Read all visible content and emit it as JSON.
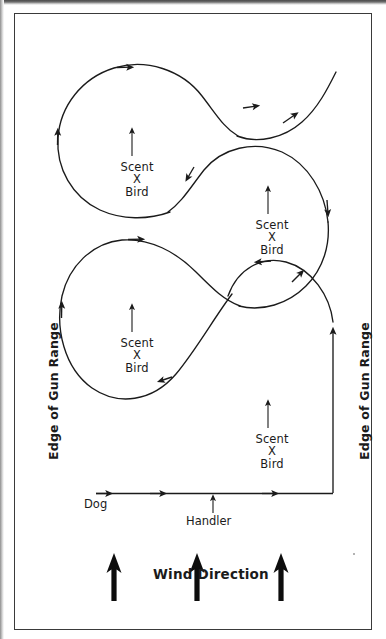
{
  "figure": {
    "line_color": "#1b1b1b",
    "frame_color": "#3a3a3a",
    "background": "#ffffff"
  },
  "labels": {
    "edge_left": "Edge of Gun Range",
    "edge_right": "Edge of Gun Range",
    "dog": "Dog",
    "handler": "Handler",
    "wind": "Wind Direction"
  },
  "scent_markers": [
    {
      "id": "scent-1",
      "line1": "Scent",
      "line2": "X",
      "line3": "Bird",
      "x": 137,
      "y": 161
    },
    {
      "id": "scent-2",
      "line1": "Scent",
      "line2": "X",
      "line3": "Bird",
      "x": 272,
      "y": 219
    },
    {
      "id": "scent-3",
      "line1": "Scent",
      "line2": "X",
      "line3": "Bird",
      "x": 137,
      "y": 337
    },
    {
      "id": "scent-4",
      "line1": "Scent",
      "line2": "X",
      "line3": "Bird",
      "x": 272,
      "y": 433
    }
  ],
  "wind_arrows": [
    {
      "id": "wind-arrow-1",
      "x": 114
    },
    {
      "id": "wind-arrow-2",
      "x": 197
    },
    {
      "id": "wind-arrow-3",
      "x": 281
    }
  ],
  "chart_data": {
    "type": "diagram",
    "annotations": [
      "Edge of Gun Range",
      "Edge of Gun Range",
      "Dog",
      "Handler",
      "Wind Direction",
      "Scent X Bird"
    ],
    "elements": [
      {
        "name": "dog-path",
        "kind": "serpentine-curve",
        "direction": "counter-clockwise loops advancing upward"
      },
      {
        "name": "handler-path",
        "kind": "horizontal-line-with-arrowheads",
        "arrowheads": 3
      },
      {
        "name": "right-vertical-path",
        "kind": "vertical-line-with-arrowhead",
        "arrowheads": 1
      },
      {
        "name": "wind-arrows",
        "kind": "thick-up-arrows",
        "count": 3
      },
      {
        "name": "scent-pointers",
        "kind": "thin-up-arrows",
        "count": 4
      }
    ]
  }
}
